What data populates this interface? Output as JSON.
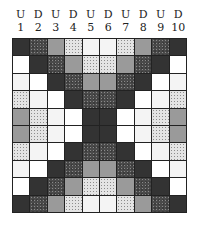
{
  "legend": {
    "K": {
      "name": "black",
      "color": "#333333"
    },
    "S": {
      "name": "dark-speckled",
      "color": "#4a4a4a"
    },
    "G": {
      "name": "medium-gray",
      "color": "#9a9a9a"
    },
    "L": {
      "name": "light-speckled",
      "color": "#d4d4d4"
    },
    "V": {
      "name": "very-light-speckled",
      "color": "#f4f4f4"
    },
    "W": {
      "name": "white",
      "color": "#ffffff"
    }
  },
  "columns": [
    {
      "dir": "U",
      "num": "1"
    },
    {
      "dir": "D",
      "num": "2"
    },
    {
      "dir": "U",
      "num": "3"
    },
    {
      "dir": "D",
      "num": "4"
    },
    {
      "dir": "U",
      "num": "5"
    },
    {
      "dir": "D",
      "num": "6"
    },
    {
      "dir": "U",
      "num": "7"
    },
    {
      "dir": "D",
      "num": "8"
    },
    {
      "dir": "U",
      "num": "9"
    },
    {
      "dir": "D",
      "num": "10"
    }
  ],
  "rows": [
    [
      "K",
      "S",
      "G",
      "L",
      "V",
      "V",
      "L",
      "G",
      "S",
      "K"
    ],
    [
      "W",
      "K",
      "S",
      "G",
      "L",
      "L",
      "G",
      "S",
      "K",
      "W"
    ],
    [
      "V",
      "W",
      "K",
      "S",
      "G",
      "G",
      "S",
      "K",
      "W",
      "V"
    ],
    [
      "L",
      "V",
      "W",
      "K",
      "S",
      "S",
      "K",
      "W",
      "V",
      "L"
    ],
    [
      "G",
      "L",
      "V",
      "W",
      "K",
      "K",
      "W",
      "V",
      "L",
      "G"
    ],
    [
      "G",
      "L",
      "V",
      "W",
      "K",
      "K",
      "W",
      "V",
      "L",
      "G"
    ],
    [
      "L",
      "V",
      "W",
      "K",
      "S",
      "S",
      "K",
      "W",
      "V",
      "L"
    ],
    [
      "V",
      "W",
      "K",
      "S",
      "G",
      "G",
      "S",
      "K",
      "W",
      "V"
    ],
    [
      "W",
      "K",
      "S",
      "G",
      "L",
      "L",
      "G",
      "S",
      "K",
      "W"
    ],
    [
      "K",
      "S",
      "G",
      "L",
      "V",
      "V",
      "L",
      "G",
      "S",
      "K"
    ]
  ]
}
